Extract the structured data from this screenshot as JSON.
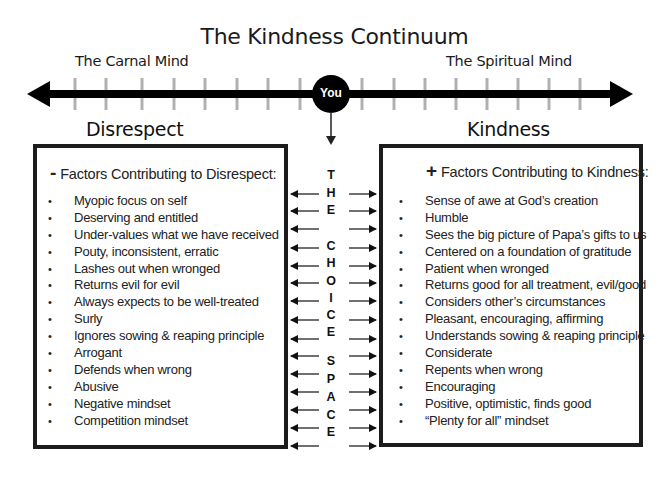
{
  "title": "The Kindness Continuum",
  "continuum": {
    "left_label": "The Carnal Mind",
    "right_label": "The Spiritual Mind",
    "center_marker": "You",
    "tick_count_left": 8,
    "tick_count_right": 8
  },
  "left_panel": {
    "heading": "Disrespect",
    "sign": "-",
    "header": "Factors Contributing to Disrespect:",
    "items": [
      "Myopic focus on self",
      "Deserving and entitled",
      "Under-values what we have received",
      "Pouty, inconsistent, erratic",
      "Lashes out when wronged",
      "Returns evil for evil",
      "Always expects to be well-treated",
      "Surly",
      "Ignores sowing & reaping principle",
      "Arrogant",
      "Defends when wrong",
      "Abusive",
      "Negative mindset",
      "Competition mindset"
    ]
  },
  "right_panel": {
    "heading": "Kindness",
    "sign": "+",
    "header": "Factors Contributing to Kindness:",
    "items": [
      "Sense of awe at God’s creation",
      "Humble",
      "Sees the big picture of Papa’s gifts to us",
      "Centered on a foundation of gratitude",
      "Patient when wronged",
      "Returns good for all treatment, evil/good",
      "Considers other’s circumstances",
      "Pleasant, encouraging, affirming",
      "Understands sowing & reaping principle",
      "Considerate",
      "Repents when wrong",
      "Encouraging",
      "Positive, optimistic, finds good",
      "“Plenty for all” mindset"
    ]
  },
  "choice_space": {
    "letters": [
      "T",
      "H",
      "E",
      "",
      "C",
      "H",
      "O",
      "I",
      "C",
      "E",
      "",
      "S",
      "P",
      "A",
      "C",
      "E"
    ],
    "arrow_rows": 15
  },
  "bullet_glyph": "•",
  "colors": {
    "axis": "#000000",
    "ticks": "#b0b0b0",
    "text": "#1a1a1a",
    "box_border": "#1c1c1c",
    "background": "#ffffff"
  }
}
